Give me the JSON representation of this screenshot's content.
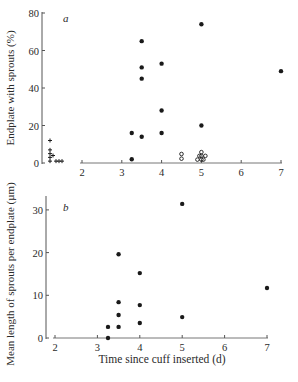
{
  "figure": {
    "xlabel": "Time since cuff inserted (d)"
  },
  "chart_data": [
    {
      "type": "scatter",
      "panel": "a",
      "title": "",
      "xlabel": "",
      "ylabel": "Endplate with sprouts (%)",
      "xlim": [
        2,
        7
      ],
      "ylim": [
        0,
        80
      ],
      "xticks": [
        2,
        3,
        4,
        5,
        6,
        7
      ],
      "yticks": [
        0,
        20,
        40,
        60,
        80
      ],
      "grid": false,
      "series": [
        {
          "name": "filled",
          "marker": "filled-circle",
          "points": [
            [
              3.25,
              2
            ],
            [
              3.25,
              16
            ],
            [
              3.5,
              14
            ],
            [
              3.5,
              45
            ],
            [
              3.5,
              51
            ],
            [
              3.5,
              65
            ],
            [
              4,
              16
            ],
            [
              4,
              28
            ],
            [
              4,
              53
            ],
            [
              5,
              20
            ],
            [
              5,
              74
            ],
            [
              7,
              49
            ]
          ]
        },
        {
          "name": "open",
          "marker": "open-circle",
          "points": [
            [
              4.5,
              1.5
            ],
            [
              4.5,
              4
            ],
            [
              4.9,
              1
            ],
            [
              4.95,
              3
            ],
            [
              5,
              1
            ],
            [
              5,
              3
            ],
            [
              5,
              5
            ],
            [
              5.05,
              1
            ],
            [
              5.1,
              3
            ]
          ]
        },
        {
          "name": "control",
          "marker": "cross",
          "x_position": "left of axis start",
          "points": [
            [
              1.2,
              12
            ],
            [
              1.2,
              7
            ],
            [
              1.2,
              5
            ],
            [
              1.2,
              3
            ],
            [
              1.2,
              1
            ],
            [
              1.3,
              4
            ],
            [
              1.4,
              1
            ],
            [
              1.5,
              1
            ],
            [
              1.6,
              1
            ]
          ]
        }
      ]
    },
    {
      "type": "scatter",
      "panel": "b",
      "title": "",
      "xlabel": "Time since cuff inserted (d)",
      "ylabel": "Mean length of sprouts per endplate (µm)",
      "xlim": [
        2,
        7
      ],
      "ylim": [
        0,
        33
      ],
      "xticks": [
        2,
        3,
        4,
        5,
        6,
        7
      ],
      "yticks": [
        0,
        10,
        20,
        30
      ],
      "grid": false,
      "series": [
        {
          "name": "filled",
          "marker": "filled-circle",
          "points": [
            [
              3.25,
              0
            ],
            [
              3.25,
              2.6
            ],
            [
              3.5,
              2.6
            ],
            [
              3.5,
              5.4
            ],
            [
              3.5,
              8.4
            ],
            [
              3.5,
              19.6
            ],
            [
              4,
              3.5
            ],
            [
              4,
              7.7
            ],
            [
              4,
              15.2
            ],
            [
              5,
              4.9
            ],
            [
              5,
              31.4
            ],
            [
              7,
              11.7
            ]
          ]
        }
      ]
    }
  ],
  "panels": {
    "a": {
      "label": "a",
      "ylabel": "Endplate with sprouts (%)",
      "ytick_labels": [
        "0",
        "20",
        "40",
        "60",
        "80"
      ],
      "xtick_labels": [
        "2",
        "3",
        "4",
        "5",
        "6",
        "7"
      ]
    },
    "b": {
      "label": "b",
      "ylabel": "Mean length of sprouts per endplate (µm)",
      "ytick_labels": [
        "0",
        "10",
        "20",
        "30"
      ],
      "xtick_labels": [
        "2",
        "3",
        "4",
        "5",
        "6",
        "7"
      ]
    }
  },
  "colors": {
    "ink": "#1a1a1a",
    "axis": "#555555",
    "background": "#ffffff"
  }
}
